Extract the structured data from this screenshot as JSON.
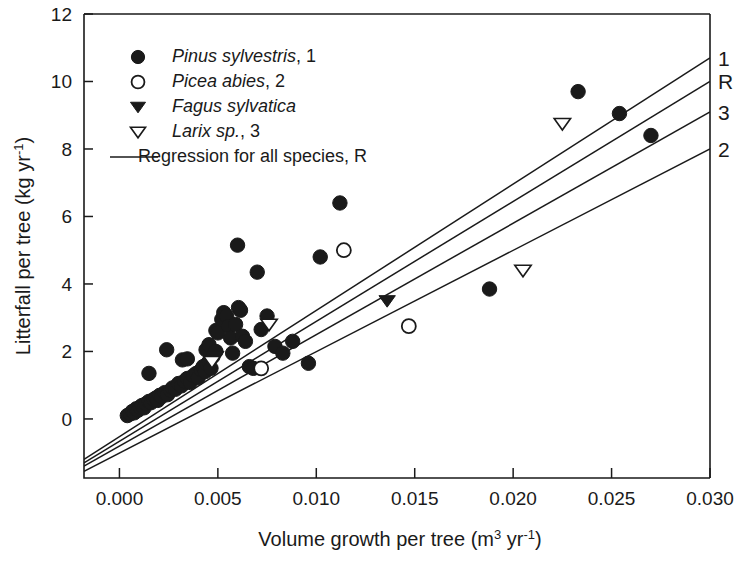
{
  "chart_data": {
    "type": "scatter",
    "title": "",
    "xlabel": "Volume growth per tree (m3 yr-1)",
    "xlabel_main": "Volume growth per tree (m",
    "xlabel_sup1": "3",
    "xlabel_mid": " yr",
    "xlabel_sup2": "-1",
    "xlabel_end": ")",
    "ylabel": "Litterfall per tree (kg yr-1)",
    "ylabel_main": "Litterfall per tree (kg yr",
    "ylabel_sup": "-1",
    "ylabel_end": ")",
    "xlim": [
      -0.0018,
      0.03
    ],
    "ylim": [
      -1.75,
      12
    ],
    "xticks": [
      0.0,
      0.005,
      0.01,
      0.015,
      0.02,
      0.025,
      0.03
    ],
    "xtick_labels": [
      "0.000",
      "0.005",
      "0.010",
      "0.015",
      "0.020",
      "0.025",
      "0.030"
    ],
    "yticks": [
      0,
      2,
      4,
      6,
      8,
      10,
      12
    ],
    "ytick_labels": [
      "0",
      "2",
      "4",
      "6",
      "8",
      "10",
      "12"
    ],
    "grid": false,
    "legend_position": "upper-left",
    "series": [
      {
        "name": "Pinus sylvestris, 1",
        "label": "Pinus sylvestris",
        "label_italic": "Pinus sylvestris",
        "label_suffix": ", 1",
        "marker": "filled-circle",
        "color": "#1a1a1a",
        "points": [
          [
            0.0004,
            0.1
          ],
          [
            0.00055,
            0.15
          ],
          [
            0.00065,
            0.22
          ],
          [
            0.00075,
            0.18
          ],
          [
            0.00085,
            0.3
          ],
          [
            0.00095,
            0.26
          ],
          [
            0.00105,
            0.35
          ],
          [
            0.00115,
            0.4
          ],
          [
            0.00125,
            0.33
          ],
          [
            0.00135,
            0.45
          ],
          [
            0.0015,
            0.52
          ],
          [
            0.0016,
            0.48
          ],
          [
            0.00175,
            0.58
          ],
          [
            0.00185,
            0.62
          ],
          [
            0.00195,
            0.55
          ],
          [
            0.00205,
            0.7
          ],
          [
            0.00215,
            0.66
          ],
          [
            0.0023,
            0.78
          ],
          [
            0.00245,
            0.72
          ],
          [
            0.0026,
            0.85
          ],
          [
            0.0027,
            0.92
          ],
          [
            0.00285,
            0.88
          ],
          [
            0.003,
            1.05
          ],
          [
            0.00315,
            0.98
          ],
          [
            0.0033,
            1.12
          ],
          [
            0.00345,
            1.2
          ],
          [
            0.0036,
            1.08
          ],
          [
            0.00375,
            1.28
          ],
          [
            0.0039,
            1.35
          ],
          [
            0.004,
            1.22
          ],
          [
            0.00415,
            1.45
          ],
          [
            0.00425,
            1.55
          ],
          [
            0.00435,
            1.4
          ],
          [
            0.00445,
            1.62
          ],
          [
            0.00455,
            1.7
          ],
          [
            0.00465,
            1.5
          ],
          [
            0.0044,
            2.05
          ],
          [
            0.00455,
            2.2
          ],
          [
            0.00475,
            1.85
          ],
          [
            0.0049,
            2.0
          ],
          [
            0.0015,
            1.35
          ],
          [
            0.0024,
            2.05
          ],
          [
            0.0032,
            1.75
          ],
          [
            0.00345,
            1.78
          ],
          [
            0.0049,
            2.62
          ],
          [
            0.005,
            2.55
          ],
          [
            0.0052,
            2.95
          ],
          [
            0.0053,
            3.15
          ],
          [
            0.00545,
            3.05
          ],
          [
            0.00555,
            2.75
          ],
          [
            0.00565,
            2.4
          ],
          [
            0.00575,
            1.95
          ],
          [
            0.0059,
            2.8
          ],
          [
            0.006,
            5.15
          ],
          [
            0.00605,
            3.3
          ],
          [
            0.00615,
            3.22
          ],
          [
            0.00625,
            2.45
          ],
          [
            0.0064,
            2.3
          ],
          [
            0.0066,
            1.55
          ],
          [
            0.0068,
            1.5
          ],
          [
            0.007,
            4.35
          ],
          [
            0.0072,
            2.65
          ],
          [
            0.0075,
            3.05
          ],
          [
            0.0079,
            2.15
          ],
          [
            0.0083,
            1.95
          ],
          [
            0.0088,
            2.3
          ],
          [
            0.0096,
            1.65
          ],
          [
            0.0102,
            4.8
          ],
          [
            0.0112,
            6.4
          ],
          [
            0.0188,
            3.85
          ],
          [
            0.0233,
            9.7
          ],
          [
            0.0254,
            9.05
          ],
          [
            0.027,
            8.4
          ]
        ]
      },
      {
        "name": "Picea abies, 2",
        "label_italic": "Picea abies",
        "label_suffix": ", 2",
        "marker": "open-circle",
        "color": "#1a1a1a",
        "points": [
          [
            0.0072,
            1.5
          ],
          [
            0.0114,
            5.0
          ],
          [
            0.0147,
            2.75
          ]
        ]
      },
      {
        "name": "Fagus sylvatica",
        "label_italic": "Fagus sylvatica",
        "label_suffix": "",
        "marker": "filled-triangle",
        "color": "#1a1a1a",
        "points": [
          [
            0.0049,
            1.85
          ],
          [
            0.0136,
            3.5
          ]
        ]
      },
      {
        "name": "Larix sp., 3",
        "label_italic": "Larix sp.",
        "label_suffix": ", 3",
        "marker": "open-triangle",
        "color": "#1a1a1a",
        "points": [
          [
            0.0047,
            1.7
          ],
          [
            0.0076,
            2.8
          ],
          [
            0.0205,
            4.4
          ],
          [
            0.0225,
            8.75
          ]
        ]
      }
    ],
    "regression_lines": [
      {
        "id": "1",
        "label": "1",
        "x0": -0.0018,
        "y0": -1.2,
        "x1": 0.03,
        "y1": 10.7
      },
      {
        "id": "R",
        "label": "R",
        "x0": -0.0018,
        "y0": -1.3,
        "x1": 0.03,
        "y1": 10.0
      },
      {
        "id": "3",
        "label": "3",
        "x0": -0.0018,
        "y0": -1.4,
        "x1": 0.03,
        "y1": 9.1
      },
      {
        "id": "2",
        "label": "2",
        "x0": -0.0018,
        "y0": -1.55,
        "x1": 0.03,
        "y1": 8.0
      }
    ],
    "legend_regression": "Regression for all species, R"
  }
}
